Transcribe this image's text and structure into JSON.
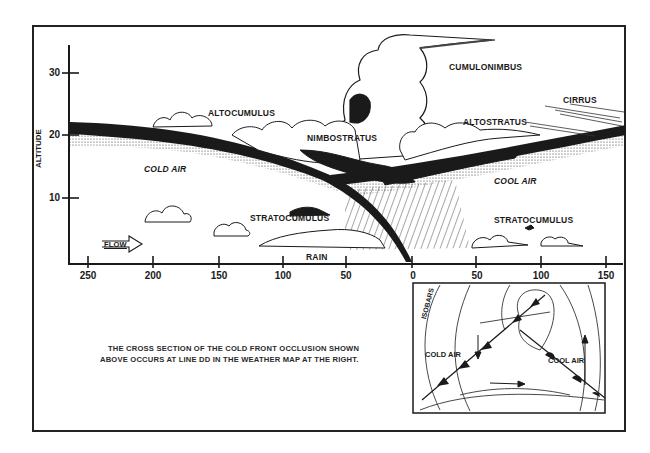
{
  "diagram": {
    "y_axis": {
      "label": "ALTITUDE",
      "ticks": [
        "30",
        "20",
        "10"
      ]
    },
    "x_axis": {
      "ticks": [
        "250",
        "200",
        "150",
        "100",
        "50",
        "0",
        "50",
        "100",
        "150"
      ]
    },
    "labels": {
      "cumulonimbus": "CUMULONIMBUS",
      "altocumulus": "ALTOCUMULUS",
      "nimbostratus": "NIMBOSTRATUS",
      "altostratus": "ALTOSTRATUS",
      "cirrus": "CIRRUS",
      "cold_air": "COLD AIR",
      "cool_air": "COOL AIR",
      "stratocumulus_left": "STRATOCUMULUS",
      "stratocumulus_right": "STRATOCUMULUS",
      "rain": "RAIN",
      "flow": "FLOW"
    },
    "caption": {
      "line1": "THE CROSS SECTION OF THE COLD FRONT OCCLUSION SHOWN",
      "line2": "ABOVE OCCURS AT LINE DD IN THE WEATHER MAP AT THE RIGHT."
    },
    "inset_map": {
      "isobars_label": "ISOBARS",
      "cold_air": "COLD AIR",
      "cool_air": "COOL AIR"
    },
    "colors": {
      "ink": "#1a1a1a",
      "background": "#ffffff"
    }
  }
}
